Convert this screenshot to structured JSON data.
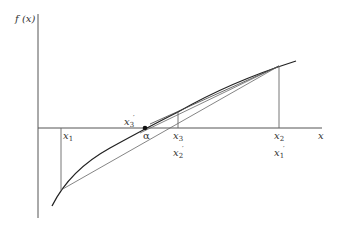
{
  "diagram": {
    "type": "secant-method-illustration",
    "y_axis_label": "f (x)",
    "x_axis_label": "x",
    "root_label": "α",
    "points": [
      {
        "id": "x1",
        "name": "x",
        "sub": "1",
        "prime": false
      },
      {
        "id": "x2",
        "name": "x",
        "sub": "2",
        "prime": false
      },
      {
        "id": "x3",
        "name": "x",
        "sub": "3",
        "prime": false
      },
      {
        "id": "x1p",
        "name": "x",
        "sub": "1",
        "prime": true
      },
      {
        "id": "x2p",
        "name": "x",
        "sub": "2",
        "prime": true
      },
      {
        "id": "x3p",
        "name": "x",
        "sub": "3",
        "prime": true
      }
    ],
    "colors": {
      "axis": "#555555",
      "curve": "#222222",
      "line": "#666666"
    }
  }
}
